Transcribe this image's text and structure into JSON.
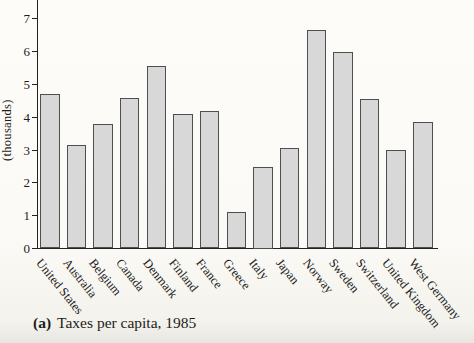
{
  "chart_data": {
    "type": "bar",
    "title": "Taxes per capita, 1985",
    "caption_label": "(a)",
    "caption_text": "Taxes per capita, 1985",
    "ylabel": "(thousands)",
    "xlabel": "",
    "categories": [
      "United States",
      "Australia",
      "Belgium",
      "Canada",
      "Denmark",
      "Finland",
      "France",
      "Greece",
      "Italy",
      "Japan",
      "Norway",
      "Sweden",
      "Switzerland",
      "United Kingdom",
      "West Germany"
    ],
    "values": [
      4.7,
      3.15,
      3.8,
      4.6,
      5.55,
      4.1,
      4.2,
      1.1,
      2.5,
      3.05,
      6.65,
      6.0,
      4.55,
      3.0,
      3.85
    ],
    "yticks": [
      0,
      1,
      2,
      3,
      4,
      5,
      6,
      7
    ],
    "ylim": [
      0,
      7.6
    ],
    "grid": false,
    "legend": false
  },
  "colors": {
    "bar_fill": "#d8d8d8",
    "bar_border": "#4f4f4f",
    "axis": "#222222",
    "text": "#1c1c1c",
    "background": "#fbfaf6"
  }
}
